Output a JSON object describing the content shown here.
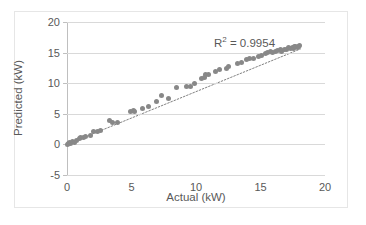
{
  "chart_data": {
    "type": "scatter",
    "title": "",
    "xlabel": "Actual (kW)",
    "ylabel": "Predicted (kW)",
    "xlim": [
      0,
      20
    ],
    "ylim": [
      -5,
      20
    ],
    "xticks": [
      0,
      5,
      10,
      15,
      20
    ],
    "yticks": [
      -5,
      0,
      5,
      10,
      15,
      20
    ],
    "grid": "horizontal",
    "legend": "none",
    "marker_color": "#888888",
    "trendline": {
      "style": "dotted",
      "color": "#808080",
      "x": [
        0.0,
        18.1
      ],
      "y": [
        0.0,
        15.6
      ]
    },
    "annotations": [
      {
        "text": "R² = 0.9954",
        "value": 0.9954,
        "label": "R²"
      }
    ],
    "series": [
      {
        "name": "Predicted vs Actual",
        "points": [
          [
            0.05,
            0.05
          ],
          [
            0.15,
            0.15
          ],
          [
            0.2,
            0.35
          ],
          [
            0.3,
            0.2
          ],
          [
            0.45,
            0.55
          ],
          [
            0.55,
            0.3
          ],
          [
            0.7,
            0.65
          ],
          [
            0.95,
            0.9
          ],
          [
            1.05,
            1.2
          ],
          [
            1.25,
            1.15
          ],
          [
            1.45,
            1.3
          ],
          [
            1.85,
            1.5
          ],
          [
            2.05,
            2.15
          ],
          [
            2.35,
            2.1
          ],
          [
            2.6,
            2.25
          ],
          [
            3.3,
            3.95
          ],
          [
            3.55,
            3.5
          ],
          [
            3.9,
            3.6
          ],
          [
            4.95,
            5.45
          ],
          [
            5.15,
            5.5
          ],
          [
            5.25,
            5.3
          ],
          [
            5.85,
            5.9
          ],
          [
            6.3,
            6.15
          ],
          [
            6.95,
            7.0
          ],
          [
            7.35,
            8.0
          ],
          [
            7.85,
            7.45
          ],
          [
            8.45,
            9.35
          ],
          [
            9.25,
            9.5
          ],
          [
            9.55,
            9.45
          ],
          [
            9.85,
            10.0
          ],
          [
            10.45,
            10.8
          ],
          [
            10.65,
            11.0
          ],
          [
            10.75,
            11.45
          ],
          [
            10.95,
            11.5
          ],
          [
            11.55,
            11.9
          ],
          [
            11.85,
            12.25
          ],
          [
            12.35,
            12.4
          ],
          [
            12.55,
            12.75
          ],
          [
            13.25,
            13.25
          ],
          [
            13.55,
            13.4
          ],
          [
            13.95,
            13.9
          ],
          [
            14.15,
            14.0
          ],
          [
            14.45,
            14.1
          ],
          [
            14.85,
            14.35
          ],
          [
            15.05,
            14.5
          ],
          [
            15.35,
            14.9
          ],
          [
            15.55,
            14.95
          ],
          [
            15.75,
            15.1
          ],
          [
            15.95,
            15.0
          ],
          [
            16.15,
            15.25
          ],
          [
            16.35,
            15.3
          ],
          [
            16.55,
            15.5
          ],
          [
            16.65,
            15.2
          ],
          [
            16.85,
            15.5
          ],
          [
            17.05,
            15.55
          ],
          [
            17.15,
            15.8
          ],
          [
            17.35,
            15.75
          ],
          [
            17.45,
            15.9
          ],
          [
            17.55,
            15.65
          ],
          [
            17.65,
            15.95
          ],
          [
            17.75,
            16.0
          ],
          [
            17.85,
            15.85
          ],
          [
            17.95,
            16.05
          ],
          [
            18.05,
            16.1
          ]
        ]
      }
    ]
  }
}
